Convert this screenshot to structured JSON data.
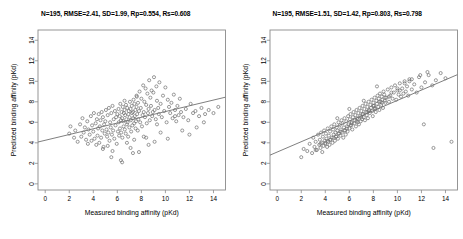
{
  "figure": {
    "width": 463,
    "height": 239,
    "background": "#ffffff",
    "point_color": "#6e6e6e",
    "line_color": "#707070",
    "frame_color": "#8a8a8a"
  },
  "panels": [
    {
      "id": "left",
      "title": "N=195, RMSE=2.41, SD=1.99, Rp=0.554, Rs=0.608",
      "stats": {
        "N": 195,
        "RMSE": 2.41,
        "SD": 1.99,
        "Rp": 0.554,
        "Rs": 0.608
      }
    },
    {
      "id": "right",
      "title": "N=195, RMSE=1.51, SD=1.42, Rp=0.803, Rs=0.798",
      "stats": {
        "N": 195,
        "RMSE": 1.51,
        "SD": 1.42,
        "Rp": 0.803,
        "Rs": 0.798
      }
    }
  ],
  "chart_data": [
    {
      "type": "scatter",
      "panel": "left",
      "title": "N=195, RMSE=2.41, SD=1.99, Rp=0.554, Rs=0.608",
      "xlabel": "Measured binding affinity (pKd)",
      "ylabel": "Predicted binding affinity (pKd)",
      "xlim": [
        -0.6,
        15.0
      ],
      "ylim": [
        -0.6,
        15.0
      ],
      "xticks": [
        0,
        2,
        4,
        6,
        8,
        10,
        12,
        14
      ],
      "yticks": [
        0,
        2,
        4,
        6,
        8,
        10,
        12,
        14
      ],
      "grid": false,
      "legend": "none",
      "marker": "open-circle",
      "fit_line": {
        "x": [
          -0.6,
          15.0
        ],
        "y": [
          4.08,
          8.45
        ],
        "slope": 0.28,
        "intercept": 4.25
      },
      "x": [
        2.0,
        2.1,
        2.4,
        2.5,
        2.7,
        2.9,
        3.0,
        3.1,
        3.2,
        3.3,
        3.4,
        3.5,
        3.55,
        3.6,
        3.7,
        3.8,
        3.85,
        3.9,
        4.0,
        4.05,
        4.1,
        4.2,
        4.25,
        4.3,
        4.35,
        4.4,
        4.45,
        4.5,
        4.55,
        4.6,
        4.65,
        4.7,
        4.75,
        4.8,
        4.85,
        4.9,
        4.95,
        5.0,
        5.05,
        5.1,
        5.15,
        5.2,
        5.25,
        5.3,
        5.35,
        5.4,
        5.45,
        5.5,
        5.55,
        5.6,
        5.65,
        5.7,
        5.75,
        5.8,
        5.85,
        5.9,
        5.95,
        6.0,
        6.05,
        6.1,
        6.12,
        6.15,
        6.2,
        6.22,
        6.25,
        6.3,
        6.32,
        6.35,
        6.4,
        6.42,
        6.45,
        6.5,
        6.52,
        6.55,
        6.6,
        6.62,
        6.65,
        6.7,
        6.72,
        6.75,
        6.8,
        6.82,
        6.85,
        6.9,
        6.92,
        6.95,
        7.0,
        7.02,
        7.05,
        7.1,
        7.12,
        7.15,
        7.2,
        7.22,
        7.25,
        7.3,
        7.32,
        7.35,
        7.4,
        7.42,
        7.45,
        7.5,
        7.52,
        7.55,
        7.6,
        7.62,
        7.65,
        7.7,
        7.72,
        7.75,
        7.8,
        7.85,
        7.9,
        7.95,
        8.0,
        8.05,
        8.1,
        8.15,
        8.2,
        8.25,
        8.3,
        8.35,
        8.4,
        8.45,
        8.5,
        8.55,
        8.6,
        8.65,
        8.7,
        8.75,
        8.8,
        8.85,
        8.9,
        8.95,
        9.0,
        9.05,
        9.1,
        9.2,
        9.25,
        9.3,
        9.4,
        9.45,
        9.5,
        9.6,
        9.7,
        9.8,
        9.9,
        10.0,
        10.1,
        10.2,
        10.3,
        10.4,
        10.5,
        10.6,
        10.7,
        10.8,
        10.9,
        11.0,
        11.1,
        11.2,
        11.3,
        11.5,
        11.7,
        11.9,
        12.1,
        12.3,
        12.5,
        12.8,
        13.0,
        13.3,
        13.6,
        14.0,
        14.4,
        4.8,
        5.2,
        5.6,
        6.3,
        6.8,
        7.1,
        7.4,
        7.8,
        8.2,
        8.6,
        9.1,
        9.6,
        10.2,
        10.8,
        11.4,
        12.0,
        12.6,
        13.2,
        5.5,
        6.4,
        7.3,
        8.4,
        9.3,
        6.6,
        7.6
      ],
      "y": [
        4.9,
        5.6,
        4.5,
        5.2,
        4.1,
        5.8,
        4.6,
        6.4,
        5.0,
        5.5,
        4.3,
        6.1,
        3.9,
        5.3,
        4.8,
        6.6,
        4.2,
        5.7,
        5.1,
        6.9,
        4.4,
        5.9,
        3.8,
        6.3,
        4.7,
        5.4,
        6.8,
        4.0,
        5.6,
        6.2,
        4.5,
        7.0,
        5.2,
        6.5,
        3.6,
        5.8,
        4.9,
        6.1,
        7.2,
        5.3,
        4.6,
        6.7,
        5.0,
        7.4,
        4.2,
        6.0,
        5.5,
        6.9,
        4.8,
        7.6,
        5.2,
        6.3,
        4.4,
        7.1,
        5.7,
        6.5,
        3.9,
        6.8,
        5.1,
        7.3,
        6.0,
        4.7,
        6.6,
        5.4,
        7.8,
        6.2,
        5.0,
        7.0,
        6.4,
        4.5,
        7.5,
        6.1,
        5.6,
        6.9,
        7.2,
        5.3,
        6.7,
        4.9,
        7.7,
        6.3,
        5.8,
        7.4,
        6.0,
        4.6,
        6.8,
        7.1,
        5.5,
        6.5,
        8.0,
        7.3,
        6.2,
        5.1,
        7.6,
        6.9,
        5.7,
        7.0,
        6.4,
        8.2,
        5.9,
        7.8,
        6.6,
        7.2,
        5.4,
        6.1,
        7.5,
        8.5,
        6.8,
        5.2,
        7.9,
        6.3,
        7.1,
        9.0,
        6.0,
        7.4,
        8.3,
        5.6,
        6.7,
        9.6,
        7.0,
        8.0,
        6.5,
        9.3,
        7.7,
        5.9,
        8.8,
        6.9,
        7.3,
        10.1,
        6.2,
        8.4,
        7.6,
        9.1,
        6.6,
        7.0,
        8.9,
        10.4,
        7.2,
        6.3,
        9.5,
        8.1,
        7.4,
        6.8,
        9.9,
        7.8,
        6.5,
        8.6,
        7.1,
        9.4,
        6.0,
        8.2,
        7.5,
        6.9,
        7.9,
        6.4,
        8.7,
        7.2,
        6.1,
        7.6,
        6.7,
        8.3,
        7.0,
        6.5,
        7.3,
        6.2,
        7.8,
        6.9,
        7.1,
        6.6,
        7.4,
        6.8,
        7.2,
        6.9,
        7.5,
        3.4,
        3.7,
        3.2,
        2.3,
        4.0,
        3.5,
        4.3,
        3.1,
        4.6,
        3.8,
        4.1,
        5.0,
        4.4,
        6.6,
        5.2,
        4.8,
        5.5,
        6.0,
        2.6,
        2.1,
        3.0,
        4.5,
        5.8,
        8.1,
        8.6
      ]
    },
    {
      "type": "scatter",
      "panel": "right",
      "title": "N=195, RMSE=1.51, SD=1.42, Rp=0.803, Rs=0.798",
      "xlabel": "Measured binding affinity (pKd)",
      "ylabel": "Predicted binding affinity (pKd)",
      "xlim": [
        -0.6,
        15.0
      ],
      "ylim": [
        -0.6,
        15.0
      ],
      "xticks": [
        0,
        2,
        4,
        6,
        8,
        10,
        12,
        14
      ],
      "yticks": [
        0,
        2,
        4,
        6,
        8,
        10,
        12,
        14
      ],
      "grid": false,
      "legend": "none",
      "marker": "open-circle",
      "fit_line": {
        "x": [
          -0.6,
          15.0
        ],
        "y": [
          2.8,
          10.65
        ],
        "slope": 0.503,
        "intercept": 3.1
      },
      "x": [
        2.0,
        2.2,
        2.5,
        2.7,
        2.9,
        3.0,
        3.1,
        3.2,
        3.3,
        3.4,
        3.5,
        3.55,
        3.6,
        3.65,
        3.7,
        3.75,
        3.8,
        3.85,
        3.9,
        3.95,
        4.0,
        4.05,
        4.1,
        4.15,
        4.2,
        4.25,
        4.3,
        4.35,
        4.4,
        4.45,
        4.5,
        4.55,
        4.6,
        4.65,
        4.7,
        4.75,
        4.8,
        4.85,
        4.9,
        4.95,
        5.0,
        5.05,
        5.1,
        5.15,
        5.2,
        5.25,
        5.3,
        5.35,
        5.4,
        5.45,
        5.5,
        5.55,
        5.6,
        5.65,
        5.7,
        5.75,
        5.8,
        5.85,
        5.9,
        5.95,
        6.0,
        6.05,
        6.1,
        6.15,
        6.2,
        6.25,
        6.3,
        6.35,
        6.4,
        6.45,
        6.5,
        6.55,
        6.6,
        6.65,
        6.7,
        6.75,
        6.8,
        6.85,
        6.9,
        6.95,
        7.0,
        7.05,
        7.1,
        7.15,
        7.2,
        7.25,
        7.3,
        7.35,
        7.4,
        7.45,
        7.5,
        7.55,
        7.6,
        7.65,
        7.7,
        7.75,
        7.8,
        7.85,
        7.9,
        7.95,
        8.0,
        8.05,
        8.1,
        8.15,
        8.2,
        8.25,
        8.3,
        8.35,
        8.4,
        8.45,
        8.5,
        8.55,
        8.6,
        8.65,
        8.7,
        8.75,
        8.8,
        8.85,
        8.9,
        8.95,
        9.0,
        9.1,
        9.2,
        9.3,
        9.4,
        9.5,
        9.6,
        9.7,
        9.8,
        9.9,
        10.0,
        10.1,
        10.2,
        10.3,
        10.4,
        10.5,
        10.6,
        10.7,
        10.8,
        10.9,
        11.0,
        11.2,
        11.4,
        11.6,
        11.8,
        12.0,
        12.3,
        12.6,
        12.9,
        13.2,
        13.6,
        14.0,
        14.5,
        4.0,
        4.4,
        4.9,
        5.3,
        5.8,
        6.2,
        6.7,
        7.1,
        7.6,
        8.0,
        8.5,
        9.0,
        9.5,
        10.0,
        10.6,
        11.2,
        11.9,
        12.5,
        13.0,
        3.2,
        3.6,
        4.2,
        4.7,
        5.1,
        5.6,
        6.1,
        6.6,
        7.0,
        7.5,
        8.1,
        8.7,
        9.3,
        10.2,
        11.0,
        12.2,
        5.0,
        6.0,
        7.2,
        8.3,
        9.7
      ],
      "y": [
        2.6,
        3.4,
        3.2,
        3.9,
        3.0,
        4.5,
        3.6,
        4.1,
        3.3,
        4.8,
        3.8,
        4.3,
        3.5,
        5.0,
        4.0,
        3.1,
        4.6,
        3.7,
        5.2,
        4.2,
        3.9,
        4.9,
        4.4,
        3.6,
        5.4,
        4.1,
        4.7,
        3.8,
        5.1,
        4.3,
        5.6,
        4.5,
        4.0,
        5.3,
        4.8,
        5.8,
        4.2,
        5.0,
        4.6,
        5.5,
        5.2,
        4.4,
        6.0,
        4.9,
        5.7,
        4.7,
        5.3,
        6.2,
        5.0,
        5.9,
        4.5,
        5.5,
        6.4,
        5.2,
        4.8,
        6.1,
        5.6,
        5.1,
        6.6,
        5.8,
        5.4,
        6.3,
        6.8,
        5.7,
        6.0,
        5.3,
        6.5,
        7.0,
        5.9,
        6.2,
        6.7,
        5.6,
        7.2,
        6.4,
        6.0,
        6.9,
        5.8,
        7.4,
        6.6,
        6.1,
        7.1,
        6.3,
        7.6,
        6.8,
        6.5,
        7.3,
        6.2,
        7.8,
        7.0,
        6.7,
        7.5,
        6.4,
        8.0,
        7.2,
        6.9,
        7.7,
        7.4,
        8.2,
        7.1,
        6.6,
        7.9,
        7.6,
        8.4,
        7.3,
        7.0,
        8.1,
        7.8,
        8.6,
        7.5,
        8.3,
        7.2,
        8.8,
        8.0,
        7.7,
        8.5,
        8.2,
        7.4,
        9.0,
        8.7,
        8.1,
        7.9,
        8.4,
        9.2,
        8.0,
        8.6,
        9.4,
        8.3,
        8.9,
        9.6,
        8.2,
        9.1,
        8.7,
        9.8,
        8.5,
        9.3,
        8.8,
        10.0,
        9.0,
        9.5,
        8.6,
        10.2,
        9.2,
        9.7,
        8.9,
        10.4,
        9.4,
        9.9,
        10.6,
        9.6,
        10.1,
        10.8,
        10.3,
        4.1,
        4.0,
        4.3,
        4.6,
        5.1,
        5.4,
        5.9,
        6.3,
        6.8,
        7.1,
        7.6,
        8.0,
        8.4,
        8.9,
        9.3,
        9.8,
        10.2,
        10.6,
        10.9,
        3.5,
        3.3,
        3.9,
        4.2,
        4.5,
        4.9,
        5.2,
        5.7,
        6.1,
        6.5,
        7.0,
        7.4,
        7.9,
        8.5,
        9.1,
        10.0,
        5.8,
        6.4,
        7.3,
        8.1,
        9.5
      ]
    }
  ]
}
